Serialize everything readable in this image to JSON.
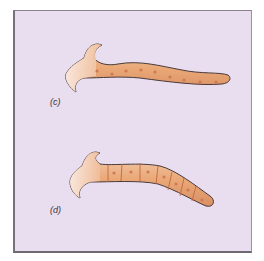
{
  "figure": {
    "panels": [
      {
        "label": "(c)",
        "description": "planarian-like worm with hammer head, unsegmented body with nuclei"
      },
      {
        "label": "(d)",
        "description": "same worm form, body divided into cells with nuclei"
      }
    ],
    "colors": {
      "background": "#e9def0",
      "body": "#e8a676",
      "body_light": "#f6dccb",
      "outline": "#4a3a3a",
      "nucleus": "#d07a55"
    }
  }
}
